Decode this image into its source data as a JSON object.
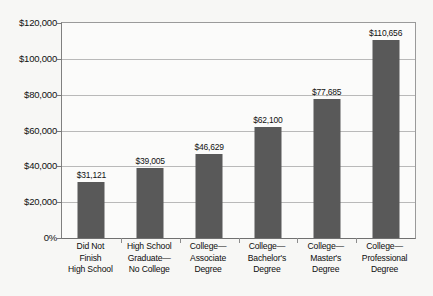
{
  "chart_data": {
    "type": "bar",
    "title": "",
    "subtitle": "",
    "xlabel": "",
    "ylabel": "",
    "categories": [
      "Did Not Finish High School",
      "High School Graduate—No College",
      "College—Associate Degree",
      "College—Bachelor's Degree",
      "College—Master's Degree",
      "College—Professional Degree"
    ],
    "category_lines": [
      [
        "Did Not",
        "Finish",
        "High School"
      ],
      [
        "High School",
        "Graduate—",
        "No College"
      ],
      [
        "College—",
        "Associate",
        "Degree"
      ],
      [
        "College—",
        "Bachelor's",
        "Degree"
      ],
      [
        "College—",
        "Master's",
        "Degree"
      ],
      [
        "College—",
        "Professional",
        "Degree"
      ]
    ],
    "values": [
      31121,
      39005,
      46629,
      62100,
      77685,
      110656
    ],
    "value_labels": [
      "$31,121",
      "$39,005",
      "$46,629",
      "$62,100",
      "$77,685",
      "$110,656"
    ],
    "ylim": [
      0,
      120000
    ],
    "yticks": [
      0,
      20000,
      40000,
      60000,
      80000,
      100000,
      120000
    ],
    "ytick_labels": [
      "0%",
      "$20,000",
      "$40,000",
      "$60,000",
      "$80,000",
      "$100,000",
      "$120,000"
    ],
    "grid": true,
    "legend": "none",
    "bar_color": "#595959",
    "gridline_color": "#b9b9b9",
    "axis_color": "#7a7a7a",
    "background_color": "#f7f7f5",
    "plot_background_color": "#fbfbfa"
  }
}
